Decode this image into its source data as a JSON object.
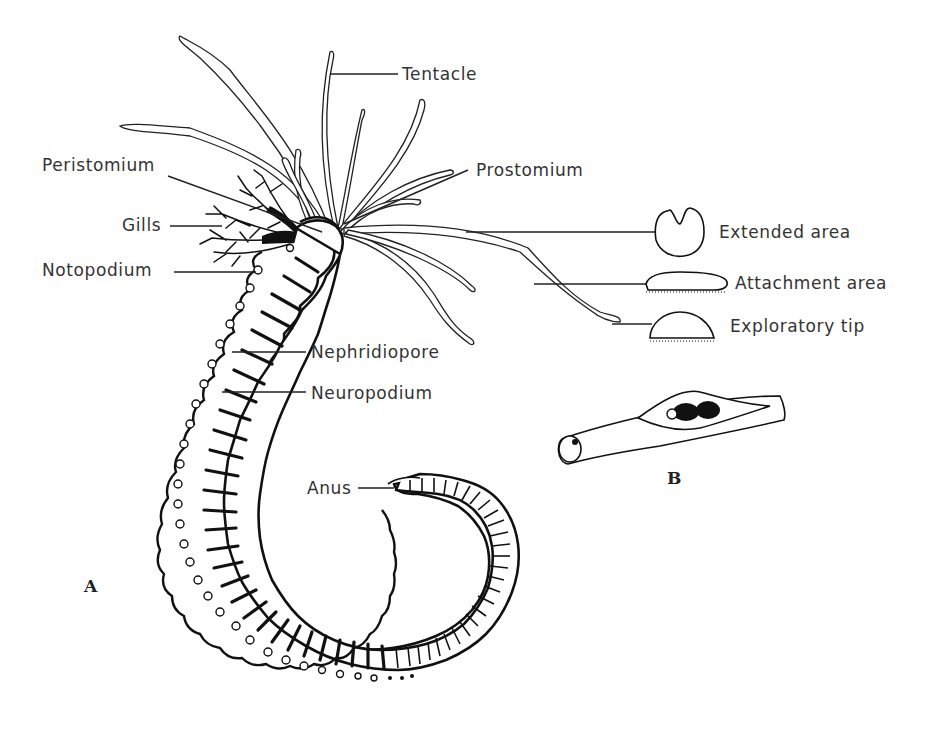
{
  "figure": {
    "type": "labeled anatomical line drawing",
    "panels": [
      {
        "id": "A",
        "label": "A"
      },
      {
        "id": "B",
        "label": "B"
      }
    ]
  },
  "labels": {
    "tentacle": "Tentacle",
    "peristomium": "Peristomium",
    "prostomium": "Prostomium",
    "gills": "Gills",
    "notopodium": "Notopodium",
    "nephridiopore": "Nephridiopore",
    "neuropodium": "Neuropodium",
    "anus": "Anus",
    "extended_area": "Extended area",
    "attachment_area": "Attachment area",
    "exploratory_tip": "Exploratory tip"
  },
  "panel_labels": {
    "a": "A",
    "b": "B"
  },
  "colors": {
    "ink": "#111111",
    "background": "#ffffff"
  }
}
